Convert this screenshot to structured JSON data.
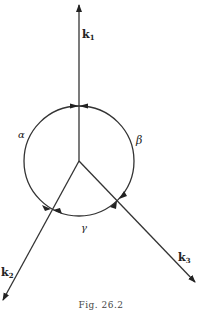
{
  "figure": {
    "caption": "Fig. 26.2",
    "vectors": [
      {
        "name": "k1",
        "label": "k",
        "subscript": "1"
      },
      {
        "name": "k2",
        "label": "k",
        "subscript": "2"
      },
      {
        "name": "k3",
        "label": "k",
        "subscript": "3"
      }
    ],
    "angles": [
      {
        "name": "alpha",
        "label": "α"
      },
      {
        "name": "beta",
        "label": "β"
      },
      {
        "name": "gamma",
        "label": "γ"
      }
    ],
    "colors": {
      "line": "#333333",
      "background": "#ffffff"
    }
  }
}
